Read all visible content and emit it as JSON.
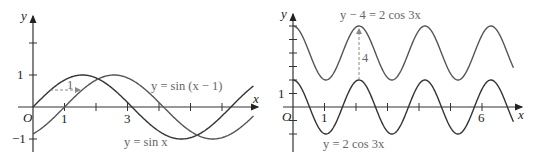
{
  "chart_data": [
    {
      "type": "line",
      "title": "",
      "xlabel": "x",
      "ylabel": "y",
      "origin_label": "O",
      "x_tick_labels": [
        "1",
        "3"
      ],
      "y_tick_labels": [
        "1",
        "-1"
      ],
      "xlim": [
        0,
        7
      ],
      "ylim": [
        -1.2,
        2.8
      ],
      "series": [
        {
          "name": "y = sin x",
          "function": "sin(x)",
          "color": "#333333",
          "label_pos": [
            5.0,
            -1.0
          ]
        },
        {
          "name": "y = sin (x−1)",
          "function": "sin(x-1)",
          "color": "#555555",
          "label_pos": [
            5.1,
            0.7
          ]
        }
      ],
      "annotations": [
        {
          "type": "dashed-arrow",
          "from": [
            0.5,
            0.48
          ],
          "to": [
            1.5,
            0.48
          ],
          "label": "1"
        }
      ],
      "grid": false
    },
    {
      "type": "line",
      "title": "",
      "xlabel": "x",
      "ylabel": "y",
      "origin_label": "O",
      "x_tick_labels": [
        "1",
        "6"
      ],
      "y_tick_labels": [
        "1"
      ],
      "xlim": [
        0,
        7
      ],
      "ylim": [
        -3,
        6.5
      ],
      "series": [
        {
          "name": "y = 2 cos 3x",
          "function": "2*cos(3*x)",
          "color": "#333333",
          "label_pos": [
            1.0,
            -3.0
          ]
        },
        {
          "name": "y − 4 = 2 cos 3x",
          "function": "4+2*cos(3*x)",
          "color": "#555555",
          "label_pos": [
            1.5,
            6.3
          ]
        }
      ],
      "annotations": [
        {
          "type": "dashed-arrow",
          "from": [
            2.094,
            2
          ],
          "to": [
            2.094,
            6
          ],
          "label": "4"
        }
      ],
      "grid": false
    }
  ],
  "labels": {
    "left": {
      "y_axis": "y",
      "x_axis": "x",
      "origin": "O",
      "tick_1": "1",
      "tick_3": "3",
      "ytick_1": "1",
      "ytick_m1": "−1",
      "shift": "1",
      "curve_shifted": "y = sin (x − 1)",
      "curve_base": "y = sin x"
    },
    "right": {
      "y_axis": "y",
      "x_axis": "x",
      "origin": "O",
      "tick_1": "1",
      "tick_6": "6",
      "ytick_1": "1",
      "shift": "4",
      "curve_shifted": "y − 4 = 2 cos 3x",
      "curve_base": "y = 2 cos 3x"
    }
  }
}
